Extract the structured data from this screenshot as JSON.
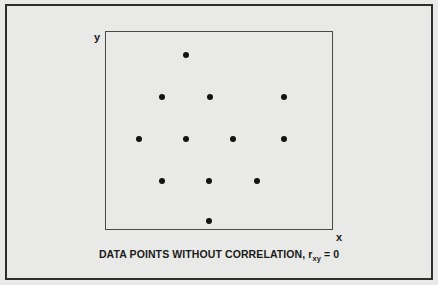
{
  "figure": {
    "background_color": "#e9e9e7",
    "frame_color": "#2e2e2e",
    "plot_border_color": "#4a4a4a",
    "point_color": "#121212",
    "caption_prefix": "DATA POINTS WITHOUT CORRELATION, r",
    "caption_subscript": "xy",
    "caption_suffix": " = 0"
  },
  "chart_data": {
    "type": "scatter",
    "title": "DATA POINTS WITHOUT CORRELATION, rxy = 0",
    "xlabel": "x",
    "ylabel": "y",
    "grid": false,
    "legend": null,
    "axis_ticks": false,
    "correlation_coefficient": 0,
    "correlation_symbol": "r_xy",
    "n_points": 12,
    "xlim": [
      0,
      228
    ],
    "ylim": [
      0,
      199
    ],
    "points": [
      {
        "x": 81,
        "y": 175
      },
      {
        "x": 57,
        "y": 133
      },
      {
        "x": 105,
        "y": 133
      },
      {
        "x": 179,
        "y": 133
      },
      {
        "x": 34,
        "y": 91
      },
      {
        "x": 81,
        "y": 91
      },
      {
        "x": 128,
        "y": 91
      },
      {
        "x": 179,
        "y": 91
      },
      {
        "x": 57,
        "y": 49
      },
      {
        "x": 104,
        "y": 49
      },
      {
        "x": 152,
        "y": 49
      },
      {
        "x": 104,
        "y": 9
      }
    ],
    "points_px": [
      {
        "left": 186,
        "top": 55
      },
      {
        "left": 162,
        "top": 97
      },
      {
        "left": 210,
        "top": 97
      },
      {
        "left": 284,
        "top": 97
      },
      {
        "left": 139,
        "top": 139
      },
      {
        "left": 186,
        "top": 139
      },
      {
        "left": 233,
        "top": 139
      },
      {
        "left": 284,
        "top": 139
      },
      {
        "left": 162,
        "top": 181
      },
      {
        "left": 209,
        "top": 181
      },
      {
        "left": 257,
        "top": 181
      },
      {
        "left": 209,
        "top": 221
      }
    ]
  }
}
